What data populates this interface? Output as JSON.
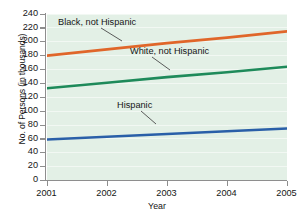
{
  "chart_data": {
    "type": "line",
    "title": "",
    "xlabel": "Year",
    "ylabel": "No. of Persons (in thousands)",
    "x": [
      2001,
      2002,
      2003,
      2004,
      2005
    ],
    "xlim": [
      2001,
      2005
    ],
    "ylim": [
      0,
      240
    ],
    "ytick_labels": [
      "240",
      "220",
      "200",
      "180",
      "160",
      "140",
      "120",
      "100",
      "80",
      "60",
      "40",
      "20",
      "0"
    ],
    "ytick_values": [
      240,
      220,
      200,
      180,
      160,
      140,
      120,
      100,
      80,
      60,
      40,
      20,
      0
    ],
    "xtick_labels": [
      "2001",
      "2002",
      "2003",
      "2004",
      "2005"
    ],
    "grid": true,
    "legend_position": "inline-annotations",
    "series": [
      {
        "name": "Black, not Hispanic",
        "color": "#e0662a",
        "values": [
          180,
          189,
          198,
          206,
          215
        ]
      },
      {
        "name": "White, not Hispanic",
        "color": "#1e8a5a",
        "values": [
          133,
          141,
          149,
          156,
          164
        ]
      },
      {
        "name": "Hispanic",
        "color": "#2a5fa8",
        "values": [
          59,
          63,
          67,
          71,
          75
        ]
      }
    ],
    "annotations": [
      {
        "text": "Black, not Hispanic",
        "series": "Black, not Hispanic"
      },
      {
        "text": "White, not Hispanic",
        "series": "White, not Hispanic"
      },
      {
        "text": "Hispanic",
        "series": "Hispanic"
      }
    ],
    "plot_background": "#e3f0e6",
    "axis_color": "#8e8e8e"
  }
}
